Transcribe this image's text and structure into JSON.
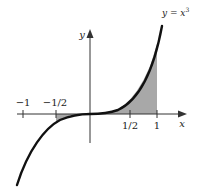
{
  "diagram": {
    "function_label": "y = x",
    "function_exponent": "3",
    "axes": {
      "x_label": "x",
      "y_label": "y"
    },
    "ticks": [
      {
        "value": -1,
        "label": "−1"
      },
      {
        "value": -0.5,
        "label": "−1/2"
      },
      {
        "value": 0.5,
        "label": "1/2"
      },
      {
        "value": 1,
        "label": "1"
      }
    ],
    "shaded_regions": [
      {
        "from": -0.5,
        "to": 0,
        "description": "area between curve and x-axis"
      },
      {
        "from": 0,
        "to": 1,
        "description": "area under curve"
      }
    ],
    "colors": {
      "curve": "#111111",
      "axis": "#333333",
      "shade": "#a8a8a8"
    }
  }
}
